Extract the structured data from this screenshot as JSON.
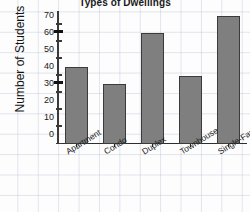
{
  "chart_data": {
    "type": "bar",
    "title": "Types of Dwellings",
    "xlabel": "",
    "ylabel": "Number of Students",
    "categories": [
      "Apartment",
      "Condo",
      "Duplex",
      "Townhouse",
      "Single-Family"
    ],
    "values": [
      45,
      35,
      65,
      40,
      75
    ],
    "ylim": [
      0,
      78
    ],
    "yticks": [
      0,
      10,
      20,
      30,
      40,
      50,
      60,
      70
    ],
    "ytick_labels": [
      "0",
      "10",
      "20",
      "30",
      "40",
      "50",
      "60",
      "70"
    ],
    "major_tick_marks": [
      35,
      65
    ],
    "grid": true,
    "grid_style": "graph-paper",
    "legend": null,
    "bar_color": "#7f7f7f",
    "bar_edge_color": "#3b3b3b",
    "background_color": "#fdfdfd",
    "gridline_color": "#96a0b9",
    "axis_color": "#3a3a3a"
  }
}
